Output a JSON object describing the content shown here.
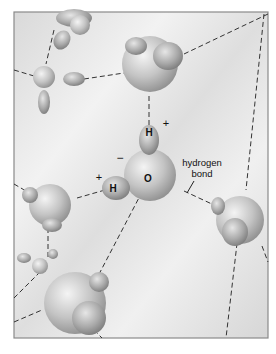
{
  "diagram": {
    "labels": {
      "hydrogen_atom_top": "H",
      "hydrogen_atom_left": "H",
      "oxygen_atom": "O",
      "charge_plus_top": "+",
      "charge_plus_left": "+",
      "charge_minus": "−",
      "hydrogen_bond_line1": "hydrogen",
      "hydrogen_bond_line2": "bond"
    },
    "colors": {
      "background": "#ffffff",
      "panel": "#e9e9e9",
      "frame": "#8a8a8a",
      "molecule": "#b9b9b9",
      "bond_line": "#333333"
    }
  }
}
